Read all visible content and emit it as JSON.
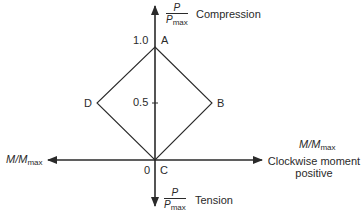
{
  "diagram": {
    "type": "interaction-diagram",
    "vertical_axis": {
      "top_label": {
        "numerator": "P",
        "denominator": "P",
        "denominator_sub": "max",
        "text": "Compression"
      },
      "bottom_label": {
        "numerator": "P",
        "denominator": "P",
        "denominator_sub": "max",
        "text": "Tension"
      },
      "ticks": [
        {
          "label": "1.0",
          "value": 1.0
        },
        {
          "label": "0.5",
          "value": 0.5
        },
        {
          "label": "0",
          "value": 0
        }
      ]
    },
    "horizontal_axis": {
      "left_label": {
        "main": "M/M",
        "sub": "max"
      },
      "right_label": {
        "main": "M/M",
        "sub": "max",
        "line1": "Clockwise moment",
        "line2": "positive"
      }
    },
    "points": [
      {
        "name": "A",
        "m": 0,
        "p": 1.0
      },
      {
        "name": "B",
        "m": 0.5,
        "p": 0.5
      },
      {
        "name": "C",
        "m": 0,
        "p": 0
      },
      {
        "name": "D",
        "m": -0.5,
        "p": 0.5
      }
    ],
    "colors": {
      "line": "#2a2a2a",
      "background": "#ffffff"
    }
  }
}
